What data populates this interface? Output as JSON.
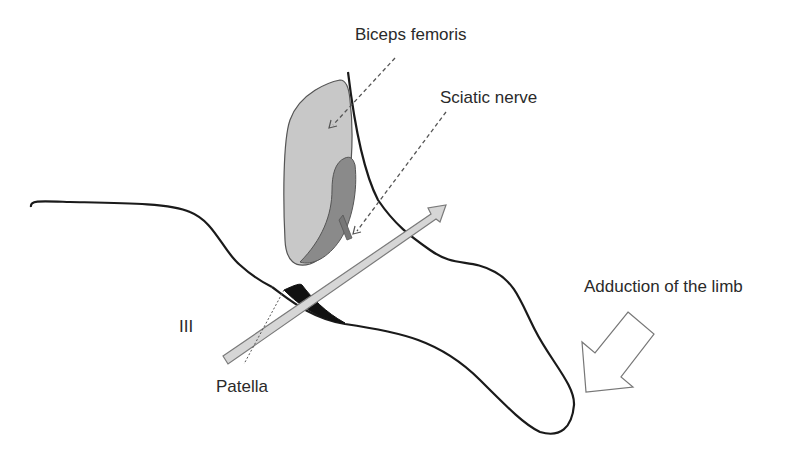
{
  "figure": {
    "labels": {
      "biceps_femoris": "Biceps femoris",
      "sciatic_nerve": "Sciatic nerve",
      "adduction": "Adduction of the limb",
      "approach": "III",
      "patella": "Patella"
    },
    "colors": {
      "outline": "#1a1a1a",
      "muscle_fill": "#c8c8c8",
      "nerve_fill": "#8a8a8a",
      "approach_arrow_fill": "#d6d6d6",
      "patella_fill": "#111111",
      "leader_line": "#555555",
      "adduction_arrow_stroke": "#777777"
    }
  }
}
